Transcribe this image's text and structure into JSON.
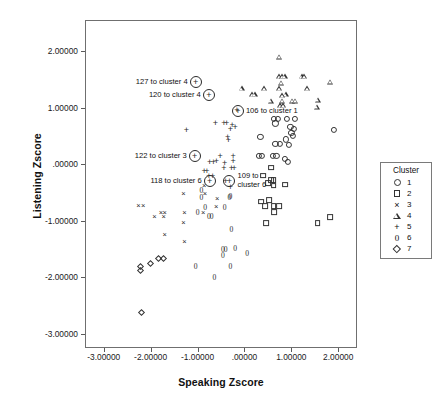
{
  "chart_data": {
    "type": "scatter",
    "title": "",
    "xlabel": "Speaking Zscore",
    "ylabel": "Listening Zscore",
    "xlim": [
      -3.4,
      2.4
    ],
    "ylim": [
      -3.25,
      2.55
    ],
    "grid": false,
    "legend_position": "right",
    "legend_title": "Cluster",
    "xticks": [
      "-3.00000",
      "-2.00000",
      "-1.00000",
      ".00000",
      "1.00000",
      "2.00000"
    ],
    "xtick_values": [
      -3,
      -2,
      -1,
      0,
      1,
      2
    ],
    "yticks": [
      "2.00000",
      "1.00000",
      ".00000",
      "-1.00000",
      "-2.00000",
      "-3.00000"
    ],
    "ytick_values": [
      2,
      1,
      0,
      -1,
      -2,
      -3
    ],
    "series": [
      {
        "name": "1",
        "marker": "circle",
        "points": [
          [
            0.62,
            0.8
          ],
          [
            0.72,
            0.8
          ],
          [
            0.9,
            0.8
          ],
          [
            1.08,
            0.8
          ],
          [
            0.66,
            0.72
          ],
          [
            0.98,
            0.66
          ],
          [
            1.06,
            0.62
          ],
          [
            1.0,
            0.56
          ],
          [
            1.04,
            0.5
          ],
          [
            0.34,
            0.48
          ],
          [
            0.88,
            0.44
          ],
          [
            0.66,
            0.36
          ],
          [
            0.76,
            0.36
          ],
          [
            0.94,
            0.34
          ],
          [
            1.9,
            0.6
          ],
          [
            0.3,
            0.14
          ],
          [
            0.38,
            0.14
          ],
          [
            0.6,
            0.14
          ],
          [
            0.68,
            0.14
          ],
          [
            0.86,
            0.1
          ],
          [
            0.92,
            0.04
          ]
        ]
      },
      {
        "name": "2",
        "marker": "square",
        "points": [
          [
            0.56,
            -0.06
          ],
          [
            0.4,
            -0.2
          ],
          [
            0.56,
            -0.28
          ],
          [
            0.62,
            -0.28
          ],
          [
            0.5,
            -0.34
          ],
          [
            0.62,
            -0.38
          ],
          [
            0.86,
            -0.36
          ],
          [
            0.36,
            -0.66
          ],
          [
            0.52,
            -0.64
          ],
          [
            0.44,
            -0.74
          ],
          [
            0.62,
            -0.74
          ],
          [
            0.64,
            -0.84
          ],
          [
            0.74,
            -0.74
          ],
          [
            0.46,
            -1.04
          ],
          [
            1.56,
            -1.04
          ],
          [
            1.82,
            -0.94
          ]
        ]
      },
      {
        "name": "3",
        "marker": "x",
        "points": [
          [
            -2.26,
            -0.74
          ],
          [
            -2.16,
            -0.74
          ],
          [
            -1.92,
            -0.94
          ],
          [
            -1.78,
            -0.86
          ],
          [
            -1.7,
            -0.86
          ],
          [
            -1.72,
            -0.94
          ],
          [
            -1.3,
            -0.52
          ],
          [
            -1.28,
            -0.86
          ],
          [
            -0.88,
            -0.86
          ],
          [
            -1.3,
            -1.04
          ],
          [
            -1.7,
            -1.26
          ],
          [
            -1.28,
            -1.38
          ],
          [
            -0.86,
            -0.38
          ],
          [
            -0.84,
            -0.52
          ],
          [
            -0.58,
            -0.62
          ],
          [
            -0.6,
            -0.76
          ]
        ]
      },
      {
        "name": "4",
        "marker": "triangle",
        "points": [
          [
            0.74,
            1.9
          ],
          [
            0.74,
            1.56
          ],
          [
            0.8,
            1.56
          ],
          [
            0.86,
            1.56
          ],
          [
            1.22,
            1.56
          ],
          [
            1.28,
            1.56
          ],
          [
            1.82,
            1.46
          ],
          [
            0.78,
            1.44
          ],
          [
            0.42,
            1.34
          ],
          [
            0.74,
            1.34
          ],
          [
            1.34,
            1.34
          ],
          [
            0.88,
            1.24
          ],
          [
            0.16,
            1.24
          ],
          [
            0.22,
            1.24
          ],
          [
            0.8,
            1.22
          ],
          [
            1.56,
            1.14
          ],
          [
            1.02,
            1.12
          ],
          [
            1.08,
            1.12
          ],
          [
            0.56,
            1.12
          ],
          [
            0.8,
            1.12
          ],
          [
            0.76,
            1.04
          ],
          [
            0.82,
            1.04
          ],
          [
            1.54,
            1.02
          ],
          [
            -0.06,
            1.34
          ]
        ]
      },
      {
        "name": "5",
        "marker": "plus",
        "points": [
          [
            -1.24,
            0.6
          ],
          [
            -0.62,
            0.72
          ],
          [
            -0.44,
            0.72
          ],
          [
            -0.38,
            0.72
          ],
          [
            -0.26,
            0.7
          ],
          [
            -0.2,
            0.66
          ],
          [
            -0.3,
            0.62
          ],
          [
            -0.36,
            0.48
          ],
          [
            -0.34,
            0.42
          ],
          [
            -0.16,
            0.96
          ],
          [
            -0.52,
            0.14
          ],
          [
            -0.6,
            0.06
          ],
          [
            -0.74,
            0.04
          ],
          [
            -0.66,
            0.04
          ],
          [
            -0.42,
            0.02
          ],
          [
            -0.24,
            0.14
          ],
          [
            -0.24,
            0.06
          ],
          [
            -0.44,
            -0.06
          ],
          [
            -0.28,
            -0.06
          ],
          [
            -0.22,
            -0.06
          ],
          [
            -0.86,
            -0.12
          ],
          [
            -0.8,
            -0.12
          ],
          [
            -0.76,
            -0.2
          ],
          [
            -0.68,
            -0.2
          ],
          [
            -0.4,
            -0.3
          ],
          [
            -0.3,
            -0.4
          ]
        ]
      },
      {
        "name": "6",
        "marker": "zero",
        "points": [
          [
            -0.92,
            -0.48
          ],
          [
            -0.92,
            -0.6
          ],
          [
            -0.84,
            -0.78
          ],
          [
            -0.76,
            -0.94
          ],
          [
            -0.7,
            -0.94
          ],
          [
            -1.0,
            -0.86
          ],
          [
            -0.42,
            -0.78
          ],
          [
            -0.3,
            -0.58
          ],
          [
            -0.32,
            -0.6
          ],
          [
            -0.28,
            -1.16
          ],
          [
            -0.46,
            -1.52
          ],
          [
            -0.4,
            -1.52
          ],
          [
            -0.46,
            -1.62
          ],
          [
            -0.2,
            -1.5
          ],
          [
            0.06,
            -1.58
          ],
          [
            -0.3,
            -1.82
          ],
          [
            -1.04,
            -1.82
          ],
          [
            -0.64,
            -2.02
          ]
        ]
      },
      {
        "name": "7",
        "marker": "diamond",
        "points": [
          [
            -2.26,
            -1.76
          ],
          [
            -2.26,
            -1.84
          ],
          [
            -2.06,
            -1.72
          ],
          [
            -1.88,
            -1.62
          ],
          [
            -1.78,
            -1.62
          ],
          [
            -2.24,
            -2.58
          ]
        ]
      }
    ],
    "annotations": [
      {
        "label": "127 to cluster 4",
        "x": -1.04,
        "y": 1.46,
        "side": "right",
        "inner": "plus"
      },
      {
        "label": "120 to cluster 4",
        "x": -0.76,
        "y": 1.22,
        "side": "right",
        "inner": "plus"
      },
      {
        "label": "106 to cluster 1",
        "x": -0.14,
        "y": 0.94,
        "side": "left",
        "inner": "plus"
      },
      {
        "label": "122 to cluster 3",
        "x": -1.06,
        "y": 0.14,
        "side": "right",
        "inner": "plus"
      },
      {
        "label": "118 to cluster 6",
        "x": -0.74,
        "y": -0.3,
        "side": "right",
        "inner": "plus"
      },
      {
        "label": "109 to\ncluster 6",
        "x": -0.32,
        "y": -0.3,
        "side": "left",
        "inner": "plus"
      }
    ]
  },
  "legend": {
    "title": "Cluster",
    "entries": [
      {
        "marker": "circle",
        "label": "1"
      },
      {
        "marker": "square",
        "label": "2"
      },
      {
        "marker": "x",
        "label": "3"
      },
      {
        "marker": "triangle",
        "label": "4"
      },
      {
        "marker": "plus",
        "label": "5"
      },
      {
        "marker": "zero",
        "label": "6"
      },
      {
        "marker": "diamond",
        "label": "7"
      }
    ]
  },
  "colors": {
    "marker": "#2a2a2a",
    "frame": "#6f6f6f",
    "text": "#111111",
    "background": "#ffffff"
  }
}
